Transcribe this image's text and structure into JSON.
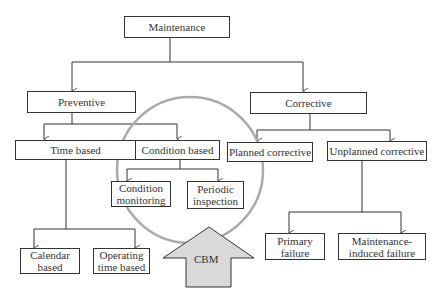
{
  "diagram": {
    "root": "Maintenance",
    "preventive": "Preventive",
    "corrective": "Corrective",
    "time_based": "Time based",
    "condition_based": "Condition based",
    "planned_corrective": "Planned corrective",
    "unplanned_corrective": "Unplanned corrective",
    "condition_monitoring": "Condition monitoring",
    "periodic_inspection": "Periodic inspection",
    "calendar_based": "Calendar based",
    "operating_time_based": "Operating time based",
    "primary_failure": "Primary failure",
    "maintenance_induced_failure": "Maintenance-induced failure",
    "cbm_label": "CBM",
    "colors": {
      "line": "#333333",
      "circle": "#aaaaaa",
      "arrow_fill": "#d9d9d9"
    }
  }
}
